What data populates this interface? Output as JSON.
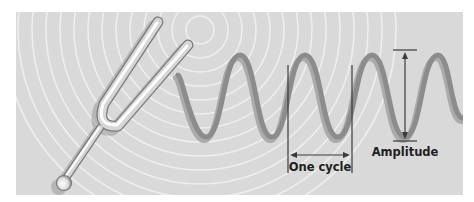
{
  "diagram": {
    "panel": {
      "x": 16,
      "y": 12,
      "width": 447,
      "height": 183,
      "background": "#d9d9d9"
    },
    "ripples": {
      "cx": 200,
      "cy": 30,
      "radii": [
        14,
        28,
        42,
        56,
        70,
        84,
        98,
        112,
        126,
        140,
        154,
        168,
        182,
        196
      ],
      "color": "#eeeeee"
    },
    "wave": {
      "color": "#8c8c8c",
      "shadow_color": "#ababab",
      "peak_y": 55,
      "trough_y": 137,
      "points": [
        [
          178,
          75
        ],
        [
          206,
          137
        ],
        [
          240,
          55
        ],
        [
          272,
          137
        ],
        [
          305,
          55
        ],
        [
          338,
          137
        ],
        [
          372,
          55
        ],
        [
          405,
          137
        ],
        [
          438,
          55
        ],
        [
          463,
          118
        ]
      ]
    },
    "tuning_fork": {
      "left_tine_top": [
        158,
        22
      ],
      "right_tine_top": [
        188,
        45
      ],
      "u_bottom": [
        100,
        126
      ],
      "stem_end": [
        64,
        181
      ],
      "ball_center": [
        64,
        183
      ]
    },
    "annotations": {
      "one_cycle": {
        "label": "One cycle",
        "left_x": 288,
        "right_x": 352,
        "line_top": 65,
        "line_bottom": 173,
        "arrow_y": 155
      },
      "amplitude": {
        "label": "Amplitude",
        "x": 405,
        "top_y": 50,
        "bottom_y": 141,
        "tick_half_width": 12
      }
    }
  }
}
